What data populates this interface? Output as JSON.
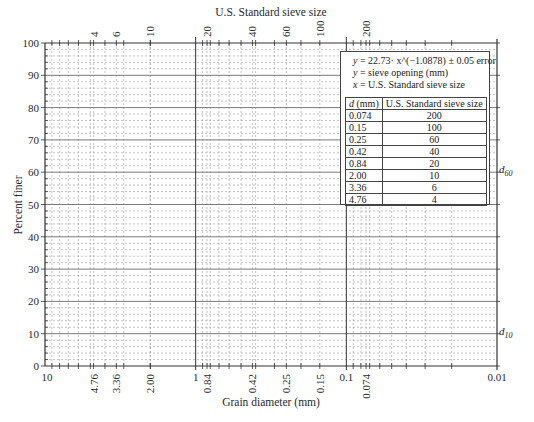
{
  "chart_data": {
    "type": "line",
    "title": "",
    "top_axis_title": "U.S. Standard sieve size",
    "xlabel": "Grain diameter (mm)",
    "ylabel": "Percent finer",
    "x_scale": "log",
    "x_reversed": true,
    "xlim": [
      10,
      0.01
    ],
    "ylim": [
      0,
      100
    ],
    "grid": true,
    "y_ticks": [
      0,
      10,
      20,
      30,
      40,
      50,
      60,
      70,
      80,
      90,
      100
    ],
    "x_tick_labels": [
      "10",
      "4.76",
      "3.36",
      "2.00",
      "1",
      "0.84",
      "0.42",
      "0.25",
      "0.15",
      "0.1",
      "0.074",
      "0.01"
    ],
    "x_tick_values": [
      10,
      4.76,
      3.36,
      2.0,
      1,
      0.84,
      0.42,
      0.25,
      0.15,
      0.1,
      0.074,
      0.01
    ],
    "top_tick_labels": [
      "4",
      "6",
      "10",
      "20",
      "40",
      "60",
      "100",
      "200"
    ],
    "top_tick_diameters": [
      4.76,
      3.36,
      2.0,
      0.84,
      0.42,
      0.25,
      0.15,
      0.074
    ],
    "right_markers": [
      {
        "label": "d",
        "sub": "60",
        "y": 60
      },
      {
        "label": "d",
        "sub": "10",
        "y": 10
      }
    ],
    "series": [],
    "legend": {
      "equation": "y = 22.73·x^(−1.0878) ± 0.05 error",
      "y_def": "y = sieve opening (mm)",
      "x_def": "x = U.S. Standard sieve size",
      "table_headers": [
        "d (mm)",
        "U.S. Standard sieve size"
      ],
      "table_rows": [
        [
          "0.074",
          "200"
        ],
        [
          "0.15",
          "100"
        ],
        [
          "0.25",
          "60"
        ],
        [
          "0.42",
          "40"
        ],
        [
          "0.84",
          "20"
        ],
        [
          "2.00",
          "10"
        ],
        [
          "3.36",
          "6"
        ],
        [
          "4.76",
          "4"
        ]
      ]
    }
  },
  "labels": {
    "top_title": "U.S. Standard sieve size",
    "x_title": "Grain diameter (mm)",
    "y_title": "Percent finer",
    "eq_line1_y": "y",
    "eq_line1_rest": " = 22.73· x^(−1.0878) ± 0.05 error",
    "eq_line2_y": "y",
    "eq_line2_rest": " = sieve opening (mm)",
    "eq_line3_x": "x",
    "eq_line3_rest": " = U.S. Standard sieve size",
    "th_d": "d",
    "th_d_unit": " (mm)",
    "th_sieve": "U.S. Standard sieve size",
    "d60_main": "d",
    "d60_sub": "60",
    "d10_main": "d",
    "d10_sub": "10"
  },
  "colors": {
    "axis": "#333333",
    "major_grid": "#7a7a7a",
    "minor_grid": "#9a9a9a",
    "text": "#222222"
  }
}
